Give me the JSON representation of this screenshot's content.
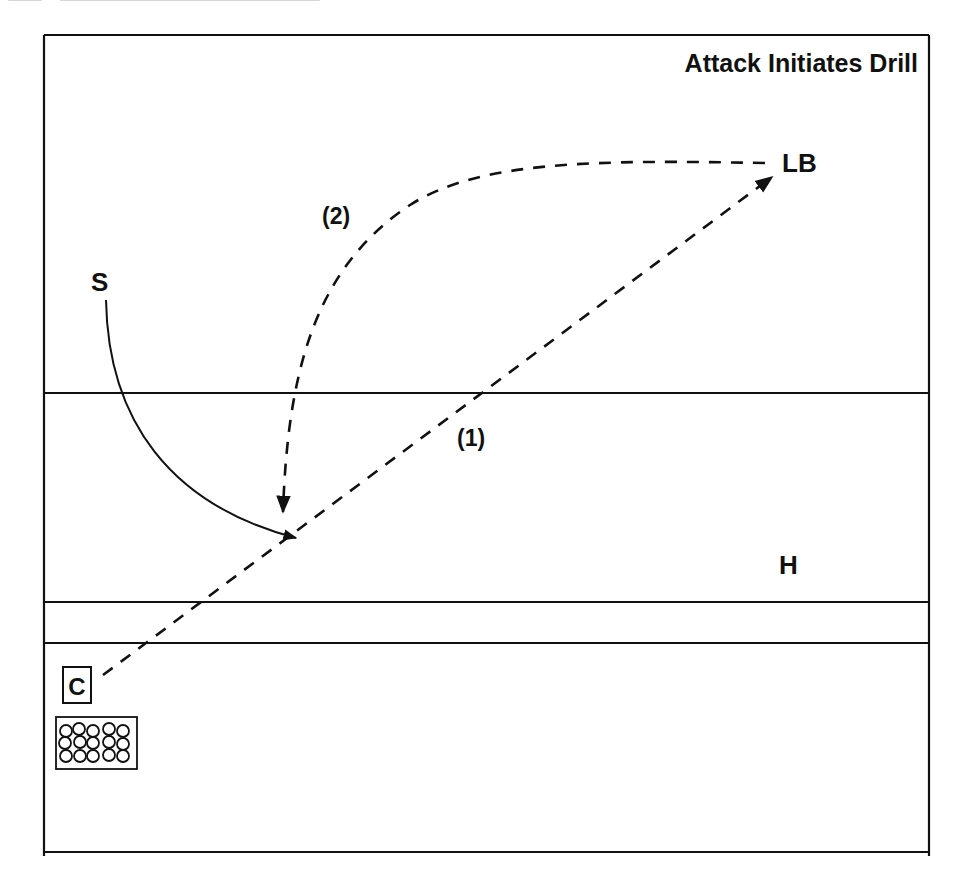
{
  "title": "Attack Initiates Drill",
  "colors": {
    "ink": "#111111",
    "background": "#ffffff"
  },
  "field": {
    "frame": {
      "left": 44,
      "top": 35,
      "right": 929,
      "bottom": 852
    },
    "horizontal_lines_y": [
      393,
      602,
      643
    ]
  },
  "players": {
    "linebacker": {
      "label": "LB",
      "x": 782,
      "y": 163
    },
    "setter": {
      "label": "S",
      "x": 98,
      "y": 281
    },
    "hitter": {
      "label": "H",
      "x": 789,
      "y": 563
    },
    "coach": {
      "label": "C",
      "x": 77,
      "y": 689
    }
  },
  "paths": {
    "path_1": {
      "label": "(1)",
      "style": "dashed",
      "from": "coach",
      "to": "linebacker"
    },
    "path_2": {
      "label": "(2)",
      "style": "dashed",
      "from": "linebacker",
      "to": "target-area"
    },
    "setter_run": {
      "style": "solid",
      "from": "setter",
      "to": "target-area"
    }
  },
  "ball_cart": {
    "label": "ball-cart",
    "rows": 3,
    "cols": 5
  }
}
